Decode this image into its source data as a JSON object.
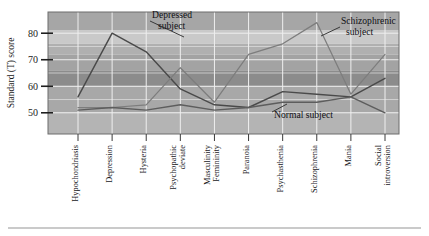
{
  "figure": {
    "background_color": "#ffffff",
    "rule_color": "#b9b9b9"
  },
  "chart_data": {
    "type": "line",
    "title": "",
    "xlabel": "",
    "ylabel": "Standard (T) score",
    "ylim": [
      42,
      88
    ],
    "yticks": [
      50,
      60,
      70,
      80
    ],
    "ytick_labels": [
      "50",
      "60",
      "70",
      "80"
    ],
    "grid": true,
    "legend_position": "inline-annotations",
    "categories": [
      "Hypochondriasis",
      "Depression",
      "Hysteria",
      "Psychopathic deviate",
      "Masculinity Femininity",
      "Paranoia",
      "Psychasthenia",
      "Schizophrenia",
      "Mania",
      "Social introversion"
    ],
    "series": [
      {
        "name": "Depressed subject",
        "color": "#4a4a4a",
        "values": [
          56,
          80,
          73,
          59,
          53,
          52,
          58,
          57,
          56,
          63
        ]
      },
      {
        "name": "Schizophrenic subject",
        "color": "#7d7d7d",
        "values": [
          52,
          52,
          53,
          67,
          54,
          72,
          76,
          84,
          57,
          72
        ]
      },
      {
        "name": "Normal subject",
        "color": "#5d5d5d",
        "values": [
          51,
          52,
          51,
          53,
          51,
          52,
          54,
          54,
          56,
          50
        ]
      }
    ],
    "annotations": [
      {
        "text_line1": "Depressed",
        "text_line2": "subject"
      },
      {
        "text_line1": "Schizophrenic",
        "text_line2": "subject"
      },
      {
        "text_line1": "Normal subject",
        "text_line2": ""
      }
    ],
    "bands": [
      {
        "from": 88,
        "to": 81,
        "color": "#a6a6a6"
      },
      {
        "from": 81,
        "to": 76,
        "color": "#c9c9c9"
      },
      {
        "from": 76,
        "to": 72,
        "color": "#b0b0b0"
      },
      {
        "from": 72,
        "to": 66,
        "color": "#a3a3a3"
      },
      {
        "from": 66,
        "to": 60,
        "color": "#8c8c8c"
      },
      {
        "from": 60,
        "to": 50,
        "color": "#a8a8a8"
      },
      {
        "from": 50,
        "to": 42,
        "color": "#b4b4b4"
      }
    ]
  }
}
